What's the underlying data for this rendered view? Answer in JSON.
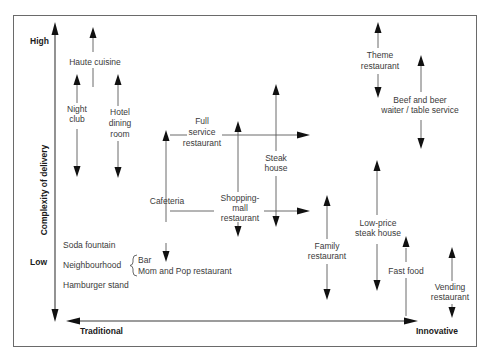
{
  "diagram": {
    "type": "positioning-map",
    "y_axis": {
      "title": "Complexity of delivery",
      "high_label": "High",
      "low_label": "Low"
    },
    "x_axis": {
      "left_label": "Traditional",
      "right_label": "Innovative"
    },
    "items": [
      {
        "id": "haute-cuisine",
        "lines": [
          "Haute cuisine"
        ]
      },
      {
        "id": "night-club",
        "lines": [
          "Night",
          "club"
        ]
      },
      {
        "id": "hotel-dining-room",
        "lines": [
          "Hotel",
          "dining",
          "room"
        ]
      },
      {
        "id": "full-service-restaurant",
        "lines": [
          "Full",
          "service",
          "restaurant"
        ]
      },
      {
        "id": "steak-house",
        "lines": [
          "Steak",
          "house"
        ]
      },
      {
        "id": "cafeteria",
        "lines": [
          "Cafeteria"
        ]
      },
      {
        "id": "shopping-mall-restaurant",
        "lines": [
          "Shopping-",
          "mall",
          "restaurant"
        ]
      },
      {
        "id": "theme-restaurant",
        "lines": [
          "Theme",
          "restaurant"
        ]
      },
      {
        "id": "beef-and-beer",
        "lines": [
          "Beef and beer",
          "waiter / table service"
        ]
      },
      {
        "id": "family-restaurant",
        "lines": [
          "Family",
          "restaurant"
        ]
      },
      {
        "id": "low-price-steak-house",
        "lines": [
          "Low-price",
          "steak house"
        ]
      },
      {
        "id": "fast-food",
        "lines": [
          "Fast food"
        ]
      },
      {
        "id": "vending-restaurant",
        "lines": [
          "Vending",
          "restaurant"
        ]
      }
    ],
    "traditional_list": {
      "soda_fountain": "Soda fountain",
      "neighbourhood": "Neighbourhood",
      "neighbourhood_types": [
        "Bar",
        "Mom and Pop restaurant"
      ],
      "hamburger_stand": "Hamburger stand"
    }
  }
}
